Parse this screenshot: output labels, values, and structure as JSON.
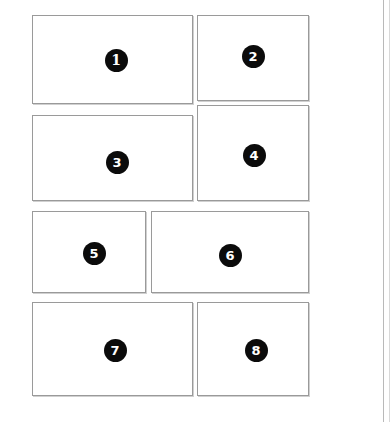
{
  "document": {
    "title": "Numbered Panel Layout",
    "background_color": "#ffffff",
    "page_edge_color": "#b9b9b9",
    "panel_border_color": "#9a9a9a",
    "badge_fill_color": "#0b0b0b",
    "badge_text_color": "#ffffff"
  },
  "page_edges": [
    {
      "name": "page-edge-inner",
      "x": 383,
      "color": "#b9b9b9"
    },
    {
      "name": "page-edge-outer",
      "x": 389,
      "color": "#d8d8d8"
    }
  ],
  "panels": [
    {
      "number": "1",
      "label": "panel-1",
      "x": 32,
      "y": 15,
      "width": 161,
      "height": 89,
      "badge": {
        "cx": 116,
        "cy": 60,
        "text": "1",
        "style": "serif"
      }
    },
    {
      "number": "2",
      "label": "panel-2",
      "x": 197,
      "y": 15,
      "width": 112,
      "height": 86,
      "badge": {
        "cx": 253,
        "cy": 56,
        "text": "2",
        "style": "sans"
      }
    },
    {
      "number": "3",
      "label": "panel-3",
      "x": 32,
      "y": 115,
      "width": 161,
      "height": 86,
      "badge": {
        "cx": 117,
        "cy": 162,
        "text": "3",
        "style": "sans"
      }
    },
    {
      "number": "4",
      "label": "panel-4",
      "x": 197,
      "y": 105,
      "width": 112,
      "height": 96,
      "badge": {
        "cx": 254,
        "cy": 155,
        "text": "4",
        "style": "sans"
      }
    },
    {
      "number": "5",
      "label": "panel-5",
      "x": 32,
      "y": 211,
      "width": 114,
      "height": 82,
      "badge": {
        "cx": 94,
        "cy": 253,
        "text": "5",
        "style": "sans"
      }
    },
    {
      "number": "6",
      "label": "panel-6",
      "x": 151,
      "y": 211,
      "width": 158,
      "height": 82,
      "badge": {
        "cx": 230,
        "cy": 255,
        "text": "6",
        "style": "sans"
      }
    },
    {
      "number": "7",
      "label": "panel-7",
      "x": 32,
      "y": 302,
      "width": 161,
      "height": 94,
      "badge": {
        "cx": 115,
        "cy": 350,
        "text": "7",
        "style": "sans"
      }
    },
    {
      "number": "8",
      "label": "panel-8",
      "x": 197,
      "y": 302,
      "width": 112,
      "height": 94,
      "badge": {
        "cx": 256,
        "cy": 350,
        "text": "8",
        "style": "sans"
      }
    }
  ]
}
